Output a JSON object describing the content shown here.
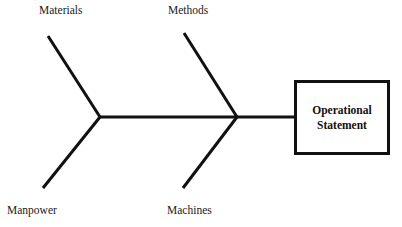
{
  "diagram": {
    "type": "fishbone-ishikawa",
    "title": "",
    "background_color": "#ffffff",
    "line_color": "#111111",
    "text_color": "#1a1a1a",
    "spine": {
      "label": "spine",
      "start_x": 100,
      "start_y": 117,
      "end_x": 294,
      "end_y": 117,
      "stroke_width": 3
    },
    "bones": [
      {
        "label": "Materials",
        "position": "top-left",
        "tip_x": 48,
        "tip_y": 36,
        "join_x": 100,
        "join_y": 117,
        "stroke_width": 3
      },
      {
        "label": "Methods",
        "position": "top-right",
        "tip_x": 184,
        "tip_y": 33,
        "join_x": 237,
        "join_y": 117,
        "stroke_width": 3
      },
      {
        "label": "Manpower",
        "position": "bottom-left",
        "tip_x": 43,
        "tip_y": 188,
        "join_x": 100,
        "join_y": 117,
        "stroke_width": 3
      },
      {
        "label": "Machines",
        "position": "bottom-right",
        "tip_x": 183,
        "tip_y": 188,
        "join_x": 237,
        "join_y": 117,
        "stroke_width": 3
      }
    ],
    "effect_box": {
      "text": "Operational\nStatement",
      "line1": "Operational",
      "line2": "Statement",
      "x": 294,
      "y": 80,
      "width": 96,
      "height": 75,
      "border_color": "#111111",
      "border_width": 3,
      "fill_color": "#ffffff"
    }
  }
}
